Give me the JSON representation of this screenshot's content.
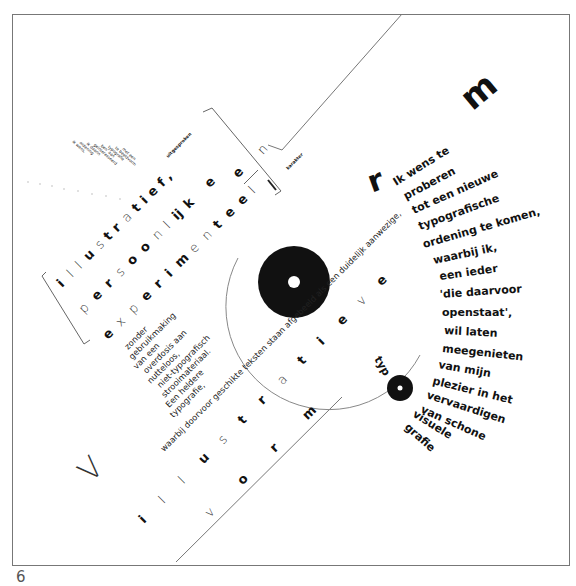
{
  "figure": {
    "number": "6"
  },
  "colors": {
    "ink": "#111111",
    "paper": "#ffffff",
    "rule": "#777777"
  },
  "headline_letters": {
    "m_top": "m",
    "n_bracket": "n",
    "e_bracket": "e",
    "r_large": "r",
    "v_large": "V"
  },
  "diagonal_words": {
    "illustratief": [
      "i",
      "l",
      "l",
      "u",
      "s",
      "t",
      "r",
      "a",
      "t",
      "i",
      "e",
      "f",
      ","
    ],
    "persoonlijke": [
      "p",
      "e",
      "r",
      "s",
      "o",
      "o",
      "n",
      "l",
      "ij",
      "k",
      "e"
    ],
    "experimenteel": [
      "e",
      "x",
      "p",
      "e",
      "r",
      "i",
      "m",
      "e",
      "n",
      "t",
      "e",
      "e",
      "l"
    ],
    "illustratieve": [
      "i",
      "l",
      "l",
      "u",
      "s",
      "t",
      "r",
      "a",
      "t",
      "i",
      "e",
      "v",
      "e"
    ],
    "vorm": [
      "v",
      "o",
      "r",
      "m"
    ]
  },
  "small_labels": {
    "uitgesproken": "uitgesproken",
    "karakter": "karakter"
  },
  "tiny_list": [
    "ik wens,",
    "ordening",
    "ik daarin",
    "geïnteresseerd",
    "ben' aan",
    "typografie",
    "te beeldvorm",
    "met een"
  ],
  "left_column": [
    "zonder",
    "gebruikmaking",
    "van een",
    "overdosis aan",
    "nutteloos,",
    "niet-typografisch",
    "strooimateriaal.",
    "Een heldere",
    "typografie,"
  ],
  "long_line": "waarbij doorvoor geschikte teksten staan afgebeeld als een duidelijk aanwezige,",
  "right_column": [
    "Ik wens te",
    "proberen",
    "tot een nieuwe",
    "typografische",
    "ordening te komen,",
    "waarbij ik,",
    "een ieder",
    "'die daarvoor",
    "openstaat',",
    "wil laten",
    "meegenieten",
    "van mijn",
    "plezier in het",
    "vervaardigen",
    "van schone",
    "visuele",
    "grafie"
  ],
  "typ_fragment": "typ"
}
